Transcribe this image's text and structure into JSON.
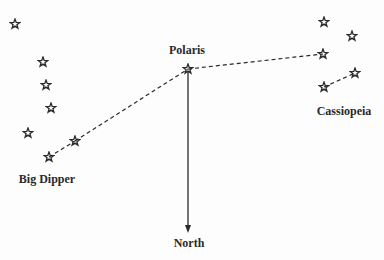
{
  "labels": {
    "polaris": "Polaris",
    "big_dipper": "Big Dipper",
    "cassiopeia": "Cassiopeia",
    "north": "North"
  },
  "colors": {
    "ink": "#2a2a2a",
    "background": "#fdfdfd"
  },
  "stars": {
    "big_dipper": [
      [
        15,
        24
      ],
      [
        43,
        62
      ],
      [
        46,
        85
      ],
      [
        51,
        108
      ],
      [
        28,
        133
      ],
      [
        75,
        141
      ],
      [
        49,
        157
      ]
    ],
    "polaris": [
      188,
      69
    ],
    "cassiopeia": [
      [
        324,
        22
      ],
      [
        352,
        36
      ],
      [
        323,
        54
      ],
      [
        355,
        73
      ],
      [
        324,
        87
      ]
    ]
  },
  "pointer_lines": [
    {
      "from": [
        49,
        157
      ],
      "to": [
        75,
        141
      ],
      "style": "dashed"
    },
    {
      "from": [
        75,
        141
      ],
      "to": [
        188,
        69
      ],
      "style": "dashed"
    },
    {
      "from": [
        188,
        69
      ],
      "to": [
        323,
        54
      ],
      "style": "dashed"
    },
    {
      "from": [
        324,
        87
      ],
      "to": [
        355,
        73
      ],
      "style": "dashed"
    }
  ],
  "north_arrow": {
    "from": [
      188,
      69
    ],
    "to": [
      188,
      232
    ]
  }
}
